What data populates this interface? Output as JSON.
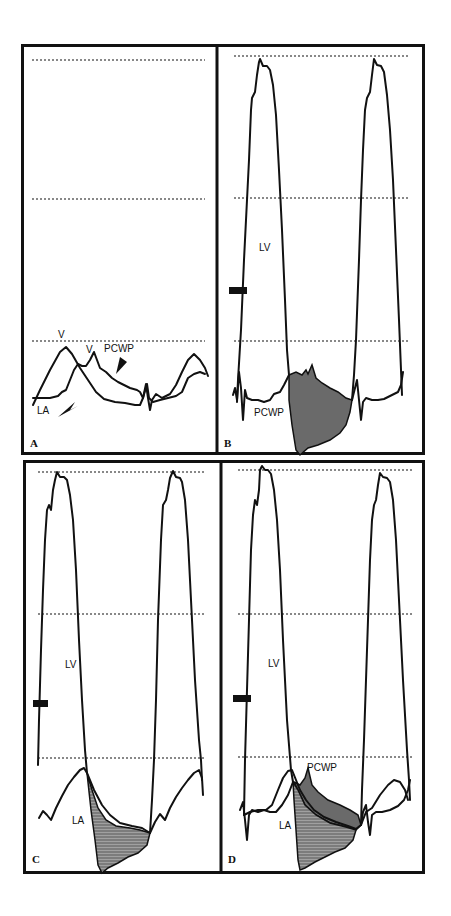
{
  "figure": {
    "colors": {
      "line": "#111111",
      "grid": "#888888",
      "fill_pcwp": "#6a6a6a",
      "fill_la": "#8a8a8a",
      "background": "#ffffff"
    },
    "panels": [
      {
        "id": "A",
        "panel_label": "A",
        "labels": {
          "v_wave_la": "V",
          "v_wave_pcwp": "V",
          "pcwp": "PCWP",
          "la": "LA"
        },
        "traces": [
          "LA",
          "PCWP"
        ],
        "arrows": [
          "PCWP arrowhead",
          "LA arrowhead"
        ]
      },
      {
        "id": "B",
        "panel_label": "B",
        "labels": {
          "lv": "LV",
          "pcwp": "PCWP"
        },
        "traces": [
          "LV",
          "PCWP"
        ],
        "shaded_region": "LV-PCWP gradient area"
      },
      {
        "id": "C",
        "panel_label": "C",
        "labels": {
          "lv": "LV",
          "la": "LA"
        },
        "traces": [
          "LV",
          "LA"
        ],
        "shaded_region": "LV-LA gradient area"
      },
      {
        "id": "D",
        "panel_label": "D",
        "labels": {
          "lv": "LV",
          "pcwp": "PCWP",
          "la": "LA"
        },
        "traces": [
          "LV",
          "LA",
          "PCWP"
        ],
        "shaded_region": "LV-PCWP and LV-LA overlapping gradient areas"
      }
    ]
  }
}
